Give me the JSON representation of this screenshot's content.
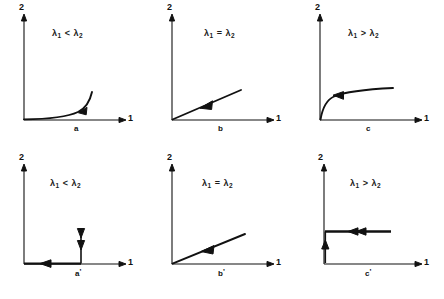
{
  "figure": {
    "background": "#ffffff",
    "ink": "#111111",
    "axis_y_label": "2",
    "axis_x_label": "1"
  },
  "panels": [
    {
      "id": "a",
      "label": "a",
      "prime": "",
      "condition": {
        "left": "λ",
        "left_sub": "1",
        "relation": "<",
        "right": "λ",
        "right_sub": "2"
      },
      "curve_type": "convex-rising",
      "arrow_direction": "down-left-along-curve",
      "description": "flat near origin then sharply rising tail"
    },
    {
      "id": "b",
      "label": "b",
      "prime": "",
      "condition": {
        "left": "λ",
        "left_sub": "1",
        "relation": "=",
        "right": "λ",
        "right_sub": "2"
      },
      "curve_type": "straight-line",
      "arrow_direction": "down-left-along-line",
      "description": "straight ray from origin, moderate slope"
    },
    {
      "id": "c",
      "label": "c",
      "prime": "",
      "condition": {
        "left": "λ",
        "left_sub": "1",
        "relation": ">",
        "right": "λ",
        "right_sub": "2"
      },
      "curve_type": "concave-rising",
      "arrow_direction": "left-along-curve",
      "description": "steep rise from origin then flattening plateau"
    },
    {
      "id": "a-prime",
      "label": "a",
      "prime": "'",
      "condition": {
        "left": "λ",
        "left_sub": "1",
        "relation": "<",
        "right": "λ",
        "right_sub": "2"
      },
      "curve_type": "horizontal-on-axis-with-vertical-infall",
      "arrow_direction": "left-along-axis-and-down",
      "description": "thick segment along horizontal axis with leftward arrow plus vertical downward arrow"
    },
    {
      "id": "b-prime",
      "label": "b",
      "prime": "'",
      "condition": {
        "left": "λ",
        "left_sub": "1",
        "relation": "=",
        "right": "λ",
        "right_sub": "2"
      },
      "curve_type": "straight-line",
      "arrow_direction": "down-left-along-line",
      "description": "straight ray from origin, shallow slope"
    },
    {
      "id": "c-prime",
      "label": "c",
      "prime": "'",
      "condition": {
        "left": "λ",
        "left_sub": "1",
        "relation": ">",
        "right": "λ",
        "right_sub": "2"
      },
      "curve_type": "horizontal-plateau-with-vertical-riser",
      "arrow_direction": "left-along-plateau-and-up",
      "description": "raised horizontal segment with leftward arrow and short vertical riser near origin"
    }
  ]
}
